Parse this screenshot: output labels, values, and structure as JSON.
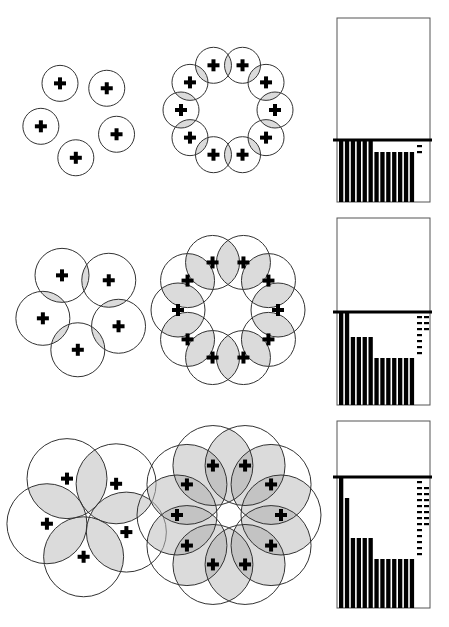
{
  "figure": {
    "rows": [
      {
        "label": "row-1",
        "ring5": {
          "cx": 80,
          "cy": 118,
          "ring_radius": 40,
          "circle_radius": 18,
          "count": 5,
          "start_angle_deg": -120
        },
        "ring10": {
          "cx": 228,
          "cy": 110,
          "ring_radius": 47,
          "circle_radius": 18,
          "count": 10,
          "start_angle_deg": -108
        },
        "histogram": {
          "box": {
            "x": 337,
            "y": 18,
            "w": 93,
            "h": 184
          },
          "threshold_y": 140,
          "bars": [
            62,
            62,
            62,
            62,
            62,
            62,
            50,
            50,
            50,
            50,
            50,
            50,
            50
          ],
          "dashes": [
            {
              "x": 417,
              "y": 145
            },
            {
              "x": 417,
              "y": 151
            }
          ]
        }
      },
      {
        "label": "row-2",
        "ring5": {
          "cx": 82,
          "cy": 310,
          "ring_radius": 40,
          "circle_radius": 27,
          "count": 5,
          "start_angle_deg": -120
        },
        "ring10": {
          "cx": 228,
          "cy": 310,
          "ring_radius": 50,
          "circle_radius": 27,
          "count": 10,
          "start_angle_deg": -108
        },
        "histogram": {
          "box": {
            "x": 337,
            "y": 218,
            "w": 93,
            "h": 187
          },
          "threshold_y": 312,
          "bars": [
            93,
            93,
            68,
            68,
            68,
            68,
            47,
            47,
            47,
            47,
            47,
            47,
            47
          ],
          "dashes": [
            {
              "x": 417,
              "y": 316
            },
            {
              "x": 424,
              "y": 316
            },
            {
              "x": 417,
              "y": 322
            },
            {
              "x": 424,
              "y": 322
            },
            {
              "x": 417,
              "y": 328
            },
            {
              "x": 424,
              "y": 328
            },
            {
              "x": 417,
              "y": 334
            },
            {
              "x": 417,
              "y": 340
            },
            {
              "x": 417,
              "y": 346
            },
            {
              "x": 417,
              "y": 352
            }
          ]
        }
      },
      {
        "label": "row-3",
        "ring5": {
          "cx": 88,
          "cy": 515,
          "ring_radius": 42,
          "circle_radius": 40,
          "count": 5,
          "start_angle_deg": -120
        },
        "ring10": {
          "cx": 229,
          "cy": 515,
          "ring_radius": 52,
          "circle_radius": 40,
          "count": 10,
          "start_angle_deg": -108
        },
        "histogram": {
          "box": {
            "x": 337,
            "y": 421,
            "w": 93,
            "h": 187
          },
          "threshold_y": 477,
          "bars": [
            131,
            110,
            70,
            70,
            70,
            70,
            49,
            49,
            49,
            49,
            49,
            49,
            49
          ],
          "dashes": [
            {
              "x": 417,
              "y": 481
            },
            {
              "x": 417,
              "y": 487
            },
            {
              "x": 424,
              "y": 487
            },
            {
              "x": 417,
              "y": 493
            },
            {
              "x": 424,
              "y": 493
            },
            {
              "x": 417,
              "y": 499
            },
            {
              "x": 424,
              "y": 499
            },
            {
              "x": 417,
              "y": 505
            },
            {
              "x": 424,
              "y": 505
            },
            {
              "x": 417,
              "y": 511
            },
            {
              "x": 424,
              "y": 511
            },
            {
              "x": 417,
              "y": 517
            },
            {
              "x": 424,
              "y": 517
            },
            {
              "x": 417,
              "y": 523
            },
            {
              "x": 424,
              "y": 523
            },
            {
              "x": 417,
              "y": 529
            },
            {
              "x": 417,
              "y": 535
            },
            {
              "x": 417,
              "y": 541
            },
            {
              "x": 417,
              "y": 547
            },
            {
              "x": 417,
              "y": 553
            }
          ]
        }
      }
    ],
    "colors": {
      "stroke": "#333333",
      "overlap_fill": "#bdbdbd",
      "bar": "#000000",
      "marker": "#000000",
      "background": "#ffffff"
    }
  }
}
